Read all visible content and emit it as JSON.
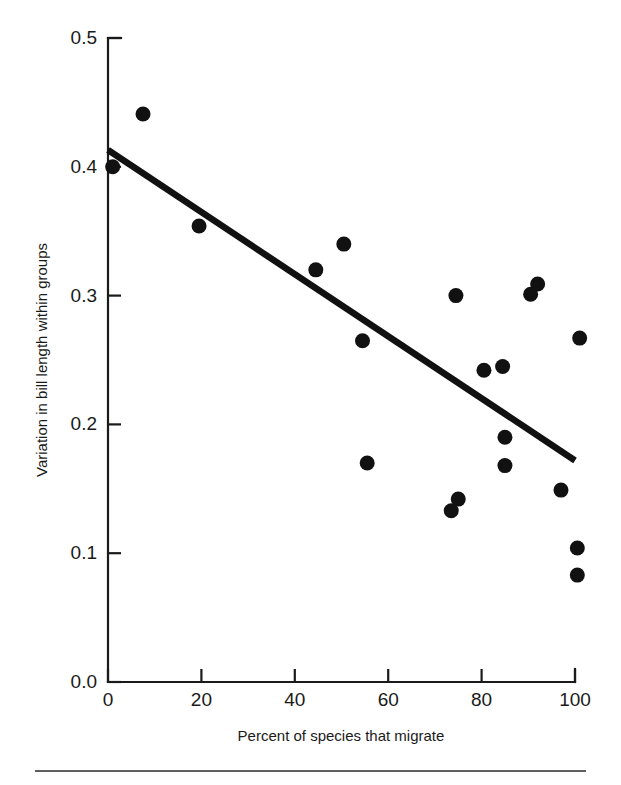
{
  "chart_data": {
    "type": "scatter",
    "title": "",
    "xlabel": "Percent of species that migrate",
    "ylabel": "Variation in bill length within groups",
    "xlim": [
      0,
      100
    ],
    "ylim": [
      0.0,
      0.5
    ],
    "xticks": [
      0,
      20,
      40,
      60,
      80,
      100
    ],
    "xticklabels": [
      "0",
      "20",
      "40",
      "60",
      "80",
      "100"
    ],
    "yticks": [
      0.0,
      0.1,
      0.2,
      0.3,
      0.4,
      0.5
    ],
    "yticklabels": [
      "0.0",
      "0.1",
      "0.2",
      "0.3",
      "0.4",
      "0.5"
    ],
    "grid": false,
    "legend": null,
    "marker": "filled-circle",
    "marker_color": "#111111",
    "points": [
      {
        "x": 1.0,
        "y": 0.4
      },
      {
        "x": 7.5,
        "y": 0.441
      },
      {
        "x": 19.5,
        "y": 0.354
      },
      {
        "x": 44.5,
        "y": 0.32
      },
      {
        "x": 50.5,
        "y": 0.34
      },
      {
        "x": 54.5,
        "y": 0.265
      },
      {
        "x": 55.5,
        "y": 0.17
      },
      {
        "x": 73.5,
        "y": 0.133
      },
      {
        "x": 75.0,
        "y": 0.142
      },
      {
        "x": 74.5,
        "y": 0.3
      },
      {
        "x": 80.5,
        "y": 0.242
      },
      {
        "x": 84.5,
        "y": 0.245
      },
      {
        "x": 85.0,
        "y": 0.19
      },
      {
        "x": 85.0,
        "y": 0.168
      },
      {
        "x": 90.5,
        "y": 0.301
      },
      {
        "x": 92.0,
        "y": 0.309
      },
      {
        "x": 97.0,
        "y": 0.149
      },
      {
        "x": 101.0,
        "y": 0.267
      },
      {
        "x": 100.5,
        "y": 0.104
      },
      {
        "x": 100.5,
        "y": 0.083
      }
    ],
    "fit_line": {
      "type": "linear-regression",
      "x_start": 0.0,
      "y_start": 0.413,
      "x_end": 100.0,
      "y_end": 0.172
    }
  },
  "figure": {
    "background_color": "#ffffff",
    "ink_color": "#111111",
    "footer_rule_visible": true
  }
}
